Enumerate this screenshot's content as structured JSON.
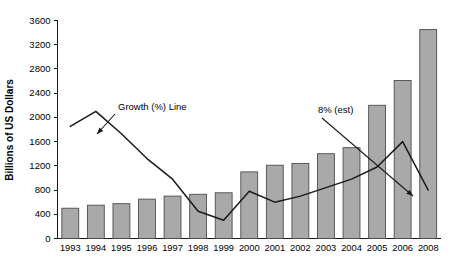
{
  "chart_data": {
    "type": "bar",
    "title": "",
    "xlabel": "",
    "ylabel": "Billions of US Dollars",
    "ylim": [
      0,
      3600
    ],
    "ytick_step": 400,
    "grid": false,
    "legend": "none",
    "categories": [
      "1993",
      "1994",
      "1995",
      "1996",
      "1997",
      "1998",
      "1999",
      "2000",
      "2001",
      "2002",
      "2003",
      "2004",
      "2005",
      "2006",
      "2008"
    ],
    "yticks": [
      "0",
      "400",
      "800",
      "1200",
      "1600",
      "2000",
      "2400",
      "2800",
      "3200",
      "3600"
    ],
    "series": [
      {
        "name": "Billions of US Dollars",
        "type": "bar",
        "values": [
          500,
          550,
          575,
          650,
          700,
          730,
          755,
          1100,
          1210,
          1240,
          1400,
          1500,
          2200,
          2610,
          3450
        ]
      },
      {
        "name": "Growth (%) Line",
        "type": "line",
        "values": [
          1850,
          2100,
          1730,
          1320,
          980,
          450,
          300,
          780,
          600,
          700,
          840,
          980,
          1180,
          1600,
          800
        ]
      }
    ],
    "annotations": [
      {
        "name": "growth-line-annotation",
        "text": "Growth (%) Line",
        "text_x": 118,
        "text_y": 110,
        "arrow_from_x": 115,
        "arrow_from_y": 114,
        "arrow_to_x": 97,
        "arrow_to_y": 134
      },
      {
        "name": "eight-percent-est-annotation",
        "text": "8% (est)",
        "text_x": 318,
        "text_y": 113,
        "arrow_from_x": 322,
        "arrow_from_y": 118,
        "arrow_to_x": 413,
        "arrow_to_y": 196
      }
    ]
  }
}
